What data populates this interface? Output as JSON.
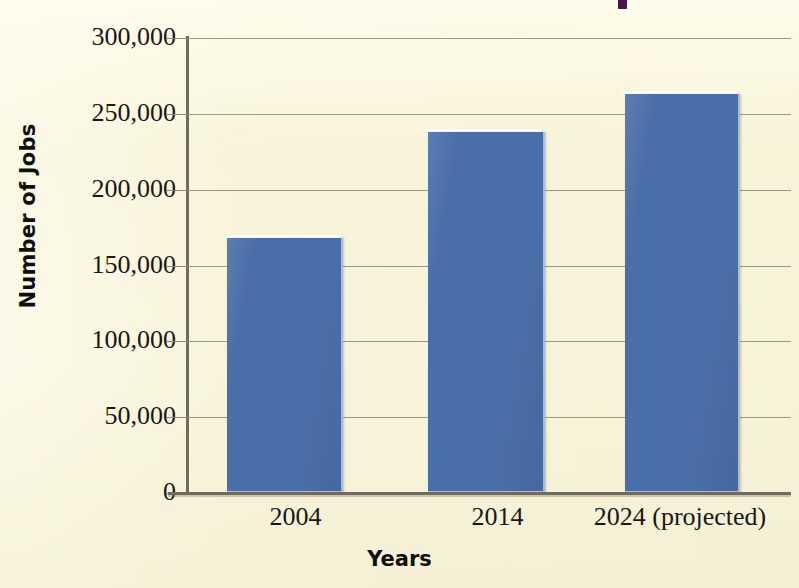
{
  "chart_data": {
    "type": "bar",
    "title": "",
    "subtitle": "",
    "xlabel": "Years",
    "ylabel": "Number of Jobs",
    "categories": [
      "2004",
      "2014",
      "2024 (projected)"
    ],
    "values": [
      168000,
      238000,
      263000
    ],
    "series": [
      {
        "name": "Number of Jobs",
        "values": [
          168000,
          238000,
          263000
        ],
        "color": "#4a6ea9"
      }
    ],
    "ylim": [
      0,
      300000
    ],
    "ytick_values": [
      0,
      50000,
      100000,
      150000,
      200000,
      250000,
      300000
    ],
    "ytick_labels": [
      "0",
      "50,000",
      "100,000",
      "150,000",
      "200,000",
      "250,000",
      "300,000"
    ],
    "grid": true,
    "grid_axis": "y",
    "legend": false,
    "legend_position": "none",
    "bar_color": "#4a6ea9",
    "background_color": "#f8f4dc",
    "axis_color": "#6f6c5c",
    "grid_color": "#8b8874",
    "text_color": "#1a1814"
  },
  "marks": {
    "top_edge_mark_color": "#4b1544"
  }
}
